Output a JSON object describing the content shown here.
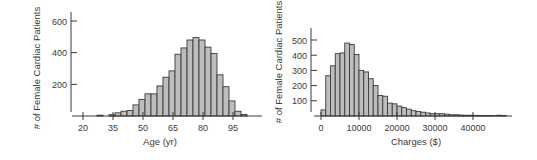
{
  "chart_data": [
    {
      "type": "bar",
      "subtype": "histogram",
      "title": "",
      "xlabel": "Age (yr)",
      "ylabel": "# of Female Cardiac Patients",
      "x_ticks": [
        20,
        35,
        50,
        65,
        80,
        95
      ],
      "x_tick_labels": [
        "20",
        "35",
        "50",
        "65",
        "80",
        "95"
      ],
      "y_ticks": [
        200,
        400,
        600
      ],
      "y_tick_labels": [
        "200",
        "400",
        "600"
      ],
      "xlim": [
        15,
        105
      ],
      "ylim": [
        0,
        650
      ],
      "bin_width": 3,
      "bin_starts": [
        27,
        30,
        33,
        36,
        39,
        42,
        45,
        48,
        51,
        54,
        57,
        60,
        63,
        66,
        69,
        72,
        75,
        78,
        81,
        84,
        87,
        90,
        93,
        96,
        99
      ],
      "values": [
        5,
        0,
        8,
        20,
        30,
        35,
        70,
        105,
        140,
        140,
        190,
        245,
        285,
        390,
        430,
        480,
        495,
        480,
        435,
        395,
        260,
        185,
        95,
        30,
        10
      ],
      "grid": false
    },
    {
      "type": "bar",
      "subtype": "histogram",
      "title": "",
      "xlabel": "Charges ($)",
      "ylabel": "# of Female Cardiac Patients",
      "x_ticks": [
        0,
        10000,
        20000,
        30000,
        40000
      ],
      "x_tick_labels": [
        "0",
        "10000",
        "20000",
        "30000",
        "40000"
      ],
      "y_ticks": [
        100,
        200,
        300,
        400,
        500
      ],
      "y_tick_labels": [
        "100",
        "200",
        "300",
        "400",
        "500"
      ],
      "xlim": [
        -500,
        50000
      ],
      "ylim": [
        0,
        560
      ],
      "bin_width": 1250,
      "bin_starts": [
        0,
        1250,
        2500,
        3750,
        5000,
        6250,
        7500,
        8750,
        10000,
        11250,
        12500,
        13750,
        15000,
        16250,
        17500,
        18750,
        20000,
        21250,
        22500,
        23750,
        25000,
        26250,
        27500,
        28750,
        30000,
        31250,
        32500,
        33750,
        35000,
        36250,
        37500,
        38750,
        40000,
        41250,
        42500,
        43750,
        45000,
        46250,
        47500
      ],
      "values": [
        40,
        265,
        330,
        410,
        415,
        480,
        470,
        405,
        300,
        290,
        245,
        200,
        135,
        130,
        85,
        80,
        65,
        55,
        45,
        35,
        30,
        25,
        20,
        15,
        15,
        15,
        12,
        8,
        8,
        6,
        5,
        5,
        4,
        4,
        3,
        3,
        2,
        5,
        3
      ],
      "grid": false
    }
  ]
}
